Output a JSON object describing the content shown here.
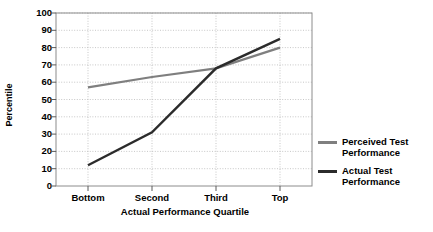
{
  "chart_data": {
    "type": "line",
    "title": "",
    "xlabel": "Actual Performance Quartile",
    "ylabel": "Percentile",
    "categories": [
      "Bottom",
      "Second",
      "Third",
      "Top"
    ],
    "yticks": [
      0,
      10,
      20,
      30,
      40,
      50,
      60,
      70,
      80,
      90,
      100
    ],
    "ylim": [
      0,
      100
    ],
    "grid": true,
    "legend_position": "right",
    "series": [
      {
        "name": "Perceived Test\nPerformance",
        "color": "#7f7f7f",
        "values": [
          57,
          63,
          68,
          80
        ]
      },
      {
        "name": "Actual Test\nPerformance",
        "color": "#2b2b2b",
        "values": [
          12,
          31,
          68,
          85
        ]
      }
    ]
  },
  "legend": {
    "items": [
      {
        "label": "Perceived Test\nPerformance",
        "color": "#7f7f7f"
      },
      {
        "label": "Actual Test\nPerformance",
        "color": "#2b2b2b"
      }
    ]
  },
  "colors": {
    "perceived": "#7f7f7f",
    "actual": "#2b2b2b",
    "grid": "#b9b9b9",
    "frame": "#8c8c8c",
    "text": "#000000"
  }
}
